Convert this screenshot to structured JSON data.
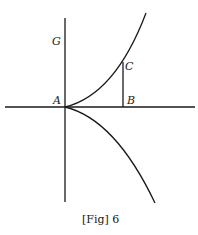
{
  "figure": {
    "caption": "[Fig] 6",
    "labels": {
      "G": "G",
      "A": "A",
      "B": "B",
      "C": "C"
    },
    "colors": {
      "ink": "#1a1a1a",
      "background": "#ffffff"
    },
    "elements": [
      "vertical axis through A",
      "horizontal axis through A",
      "upper curve from A rising to the right through C",
      "lower mirrored curve from A descending to the right",
      "vertical segment BC"
    ]
  }
}
